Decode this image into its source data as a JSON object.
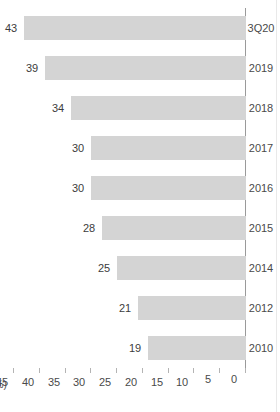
{
  "title": "제21기 누적 재무 현황",
  "right_rule": true,
  "chart_data": {
    "type": "bar",
    "orientation": "rotated-90-ccw",
    "title": "제21기 누적 재무 현황",
    "xlabel": "",
    "ylabel": "(%)",
    "unit": "(%)",
    "categories": [
      "2010",
      "2012",
      "2014",
      "2015",
      "2016",
      "2017",
      "2018",
      "2019",
      "3Q20"
    ],
    "values": [
      19,
      21,
      25,
      28,
      30,
      30,
      34,
      39,
      43
    ],
    "data_labels": [
      "19",
      "21",
      "25",
      "28",
      "30",
      "30",
      "34",
      "39",
      "43"
    ],
    "ylim": [
      0,
      45
    ],
    "yticks": [
      0,
      5,
      10,
      15,
      20,
      25,
      30,
      35,
      40,
      45
    ],
    "ytick_labels": [
      "0",
      "5",
      "10",
      "15",
      "20",
      "25",
      "30",
      "35",
      "40",
      "45"
    ],
    "grid": false,
    "legend": null,
    "bar_color": "#d4d4d4",
    "axis_color": "#9a9a9a",
    "text_color": "#4a4a4a"
  }
}
